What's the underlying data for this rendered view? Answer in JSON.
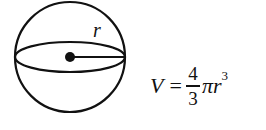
{
  "diagram": {
    "radius_label": "r",
    "stroke_color": "#111111",
    "background": "#ffffff"
  },
  "formula": {
    "lhs": "V",
    "equals": "=",
    "numerator": "4",
    "denominator": "3",
    "pi": "π",
    "variable": "r",
    "exponent": "3",
    "full_text": "V = 4/3 π r^3"
  }
}
